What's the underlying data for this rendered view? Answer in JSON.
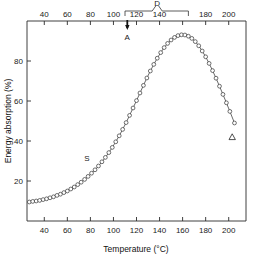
{
  "chart_data": {
    "type": "scatter",
    "title": "",
    "xlabel": "Temperature (°C)",
    "ylabel": "Energy absorption (%)",
    "xlim": [
      25,
      215
    ],
    "ylim": [
      0,
      100
    ],
    "grid": false,
    "legend": "none",
    "x_ticks": [
      40,
      60,
      80,
      100,
      120,
      140,
      160,
      180,
      200
    ],
    "x_tick_labels": [
      "40",
      "60",
      "80",
      "100",
      "120",
      "140",
      "160",
      "180",
      "200"
    ],
    "x_top_ticks": [
      40,
      60,
      80,
      100,
      120,
      140,
      160,
      180,
      200
    ],
    "x_top_tick_labels": [
      "40",
      "60",
      "80",
      "100",
      "120",
      "140",
      "160",
      "180",
      "200"
    ],
    "y_ticks": [
      20,
      40,
      60,
      80
    ],
    "y_tick_labels": [
      "20",
      "40",
      "60",
      "80"
    ],
    "top_axis": true,
    "series": [
      {
        "name": "Energy absorption vs temperature",
        "marker": "open-circle",
        "line": "solid",
        "x": [
          27,
          30,
          33,
          36,
          39,
          42,
          45,
          48,
          51,
          54,
          57,
          60,
          63,
          66,
          69,
          72,
          75,
          78,
          81,
          84,
          87,
          90,
          93,
          96,
          99,
          102,
          105,
          108,
          111,
          114,
          117,
          120,
          123,
          126,
          129,
          132,
          135,
          138,
          141,
          144,
          147,
          150,
          153,
          156,
          159,
          162,
          165,
          168,
          171,
          174,
          177,
          180,
          183,
          186,
          189,
          192,
          195,
          198,
          201,
          205
        ],
        "y": [
          9.5,
          9.8,
          10.0,
          10.3,
          10.7,
          11.1,
          11.6,
          12.1,
          12.8,
          13.4,
          14.2,
          15.0,
          16.0,
          17.0,
          18.2,
          19.4,
          20.8,
          22.3,
          23.9,
          25.6,
          27.5,
          29.6,
          31.8,
          34.2,
          36.8,
          39.6,
          42.6,
          45.8,
          49.2,
          52.8,
          56.5,
          60.2,
          64.0,
          67.8,
          71.5,
          75.0,
          78.3,
          81.4,
          84.2,
          86.7,
          88.8,
          90.5,
          91.8,
          92.7,
          93.1,
          93.0,
          92.4,
          91.3,
          89.7,
          87.6,
          85.0,
          82.1,
          78.8,
          75.2,
          71.4,
          67.4,
          63.3,
          59.1,
          54.8,
          49.0
        ]
      }
    ],
    "annotations": [
      {
        "name": "bracket-D",
        "label": "D",
        "type": "horizontal-bracket",
        "x_start": 110,
        "x_end": 165,
        "label_x": 138
      },
      {
        "name": "arrow-A",
        "label": "A",
        "type": "down-arrow-on-top-axis",
        "x": 112
      },
      {
        "name": "label-S",
        "label": "S",
        "type": "curve-label",
        "x": 77,
        "y": 30
      },
      {
        "name": "triangle-marker",
        "label": "",
        "type": "open-triangle",
        "x": 203,
        "y": 42
      }
    ]
  },
  "axes": {
    "x_title": "Temperature (°C)",
    "y_title": "Energy absorption (%)"
  }
}
